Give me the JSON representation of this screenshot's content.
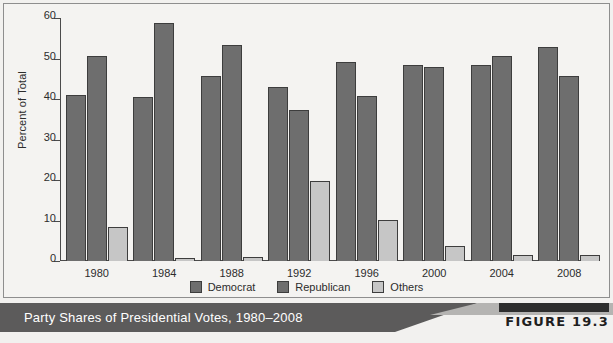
{
  "figure": {
    "caption": "Party Shares of Presidential Votes, 1980–2008",
    "tag": "FIGURE 19.3"
  },
  "chart_data": {
    "type": "bar",
    "title": "Party Shares of Presidential Votes, 1980–2008",
    "xlabel": "",
    "ylabel": "Percent of Total",
    "ylim": [
      0,
      60
    ],
    "yticks": [
      0,
      10,
      20,
      30,
      40,
      50,
      60
    ],
    "grid": false,
    "legend_position": "bottom-center",
    "categories": [
      "1980",
      "1984",
      "1988",
      "1992",
      "1996",
      "2000",
      "2004",
      "2008"
    ],
    "series": [
      {
        "name": "Democrat",
        "color": "#6e6e6e",
        "values": [
          41.0,
          40.6,
          45.6,
          43.0,
          49.2,
          48.4,
          48.3,
          52.9
        ]
      },
      {
        "name": "Republican",
        "color": "#6e6e6e",
        "values": [
          50.7,
          58.8,
          53.4,
          37.4,
          40.7,
          47.9,
          50.7,
          45.7
        ]
      },
      {
        "name": "Others",
        "color": "#c6c6c6",
        "values": [
          8.4,
          0.7,
          1.1,
          19.7,
          10.1,
          3.8,
          1.5,
          1.4
        ]
      }
    ]
  },
  "axis": {
    "y_label": "Percent of Total",
    "y_ticks": [
      "60",
      "50",
      "40",
      "30",
      "20",
      "10",
      "0"
    ],
    "x_ticks": [
      "1980",
      "1984",
      "1988",
      "1992",
      "1996",
      "2000",
      "2004",
      "2008"
    ]
  },
  "legend": {
    "items": [
      {
        "label": "Democrat",
        "key": "dem"
      },
      {
        "label": "Republican",
        "key": "rep"
      },
      {
        "label": "Others",
        "key": "oth"
      }
    ]
  }
}
